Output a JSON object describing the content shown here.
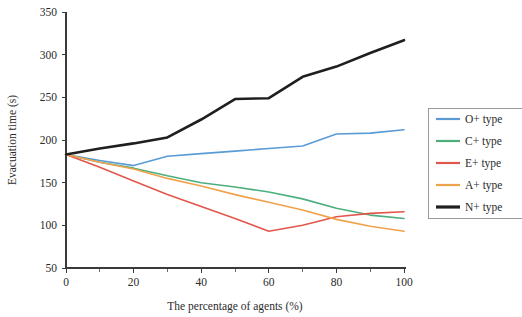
{
  "chart_data": {
    "type": "line",
    "title": "",
    "xlabel": "The percentage of agents (%)",
    "ylabel": "Evacuation time (s)",
    "xlim": [
      0,
      100
    ],
    "ylim": [
      50,
      350
    ],
    "x_ticks": [
      0,
      20,
      40,
      60,
      80,
      100
    ],
    "x_minor_ticks": [
      10,
      30,
      50,
      70,
      90
    ],
    "y_ticks": [
      50,
      100,
      150,
      200,
      250,
      300,
      350
    ],
    "grid": false,
    "legend_position": "right",
    "x": [
      0,
      10,
      20,
      30,
      40,
      50,
      60,
      70,
      80,
      90,
      100
    ],
    "series": [
      {
        "name": "O+ type",
        "color": "#5b9bd5",
        "width": 1.6,
        "values": [
          183,
          176,
          170,
          181,
          184,
          187,
          190,
          193,
          207,
          208,
          212
        ]
      },
      {
        "name": "C+ type",
        "color": "#4caf7d",
        "width": 1.6,
        "values": [
          183,
          174,
          167,
          158,
          150,
          145,
          139,
          131,
          120,
          112,
          108
        ]
      },
      {
        "name": "E+ type",
        "color": "#e2574c",
        "width": 1.6,
        "values": [
          183,
          168,
          152,
          136,
          122,
          108,
          93,
          100,
          110,
          114,
          116
        ]
      },
      {
        "name": "A+ type",
        "color": "#f0a24b",
        "width": 1.6,
        "values": [
          183,
          174,
          166,
          155,
          146,
          136,
          127,
          118,
          107,
          99,
          93
        ]
      },
      {
        "name": "N+ type",
        "color": "#1f1f1f",
        "width": 2.6,
        "values": [
          183,
          190,
          196,
          203,
          224,
          248,
          249,
          274,
          286,
          302,
          317
        ]
      }
    ]
  },
  "legend": {
    "entries": [
      {
        "label": "O+ type"
      },
      {
        "label": "C+ type"
      },
      {
        "label": "E+ type"
      },
      {
        "label": "A+ type"
      },
      {
        "label": "N+ type"
      }
    ]
  }
}
